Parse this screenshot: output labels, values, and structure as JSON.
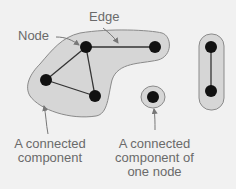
{
  "labels": {
    "edge": "Edge",
    "node": "Node",
    "component_line1": "A connected",
    "component_line2": "component",
    "single_line1": "A connected",
    "single_line2": "component of",
    "single_line3": "one node"
  },
  "colors": {
    "background": "#f1f1f1",
    "component_fill": "#d6d6d6",
    "component_stroke": "#8a8a8a",
    "node": "#111111",
    "edge": "#333333",
    "text": "#6a6a6a"
  }
}
